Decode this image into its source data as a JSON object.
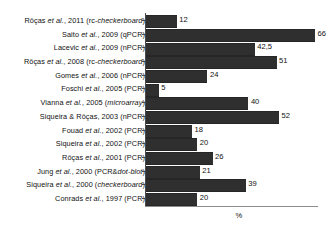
{
  "chart_data": {
    "type": "bar",
    "orientation": "horizontal",
    "title": "",
    "xlabel": "%",
    "ylabel": "",
    "xlim": [
      0,
      68
    ],
    "grid": false,
    "legend": null,
    "bar_color": "#2f2f2f",
    "axis_color": "#4a4a4a",
    "categories": [
      "Rôças et al., 2011 (rc-checkerboard)",
      "Saito et al., 2009 (qPCR)",
      "Lacevic et al., 2009 (nPCR)",
      "Rôças et al., 2008 (rc-checkerboard)",
      "Gomes et al., 2006 (nPCR)",
      "Foschi et al., 2005 (PCR)",
      "Vianna et al.,  2005 (microarray)",
      "Siqueira & Rôças, 2003 (nPCR)",
      "Fouad et al., 2002 (PCR)",
      "Siqueira et al., 2002 (PCR)",
      "Rôças et al., 2001 (PCR)",
      "Jung et al., 2000 (PCR&dot-blot)",
      "Siqueira et al., 2000 (checkerboard)",
      "Conrads et al., 1997 (PCR)"
    ],
    "values": [
      12,
      66,
      42.5,
      51,
      24,
      5,
      40,
      52,
      18,
      20,
      26,
      21,
      39,
      20
    ],
    "value_labels": [
      "12",
      "66",
      "42,5",
      "51",
      "24",
      "5",
      "40",
      "52",
      "18",
      "20",
      "26",
      "21",
      "39",
      "20"
    ],
    "rows": [
      {
        "author_plain": "Rôças ",
        "etal": "et al.",
        "rest_plain": ", 2011 (rc-",
        "method_italic": "checkerboard",
        "tail": ")",
        "value": 12,
        "value_label": "12"
      },
      {
        "author_plain": "Saito ",
        "etal": "et al.",
        "rest_plain": ", 2009 (qPCR)",
        "method_italic": "",
        "tail": "",
        "value": 66,
        "value_label": "66"
      },
      {
        "author_plain": "Lacevic ",
        "etal": "et al.",
        "rest_plain": ", 2009 (nPCR)",
        "method_italic": "",
        "tail": "",
        "value": 42.5,
        "value_label": "42,5"
      },
      {
        "author_plain": "Rôças ",
        "etal": "et al.",
        "rest_plain": ", 2008 (rc-",
        "method_italic": "checkerboard",
        "tail": ")",
        "value": 51,
        "value_label": "51"
      },
      {
        "author_plain": "Gomes ",
        "etal": "et al.",
        "rest_plain": ", 2006 (nPCR)",
        "method_italic": "",
        "tail": "",
        "value": 24,
        "value_label": "24"
      },
      {
        "author_plain": "Foschi ",
        "etal": "et al.",
        "rest_plain": ", 2005 (PCR)",
        "method_italic": "",
        "tail": "",
        "value": 5,
        "value_label": "5"
      },
      {
        "author_plain": "Vianna ",
        "etal": "et al.",
        "rest_plain": ",  2005 (",
        "method_italic": "microarray",
        "tail": ")",
        "value": 40,
        "value_label": "40"
      },
      {
        "author_plain": "Siqueira & Rôças, 2003 (nPCR)",
        "etal": "",
        "rest_plain": "",
        "method_italic": "",
        "tail": "",
        "value": 52,
        "value_label": "52"
      },
      {
        "author_plain": "Fouad ",
        "etal": "et al.",
        "rest_plain": ", 2002 (PCR)",
        "method_italic": "",
        "tail": "",
        "value": 18,
        "value_label": "18"
      },
      {
        "author_plain": "Siqueira ",
        "etal": "et al.",
        "rest_plain": ", 2002 (PCR)",
        "method_italic": "",
        "tail": "",
        "value": 20,
        "value_label": "20"
      },
      {
        "author_plain": "Rôças ",
        "etal": "et al.",
        "rest_plain": ", 2001 (PCR)",
        "method_italic": "",
        "tail": "",
        "value": 26,
        "value_label": "26"
      },
      {
        "author_plain": "Jung ",
        "etal": "et al.",
        "rest_plain": ", 2000 (PCR&",
        "method_italic": "dot-blot",
        "tail": ")",
        "value": 21,
        "value_label": "21"
      },
      {
        "author_plain": "Siqueira ",
        "etal": "et al.",
        "rest_plain": ", 2000 (",
        "method_italic": "checkerboard",
        "tail": ")",
        "value": 39,
        "value_label": "39"
      },
      {
        "author_plain": "Conrads ",
        "etal": "et al.",
        "rest_plain": ", 1997 (PCR)",
        "method_italic": "",
        "tail": "",
        "value": 20,
        "value_label": "20"
      }
    ]
  }
}
